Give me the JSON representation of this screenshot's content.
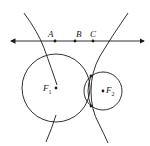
{
  "diagram": {
    "title": "",
    "colors": {
      "stroke": "#1a1a1a",
      "background": "#ffffff"
    },
    "line": {
      "name": "number-line",
      "arrows": "both"
    },
    "points": [
      {
        "label": "A",
        "x": 55,
        "y": 41
      },
      {
        "label": "B",
        "x": 75,
        "y": 41
      },
      {
        "label": "C",
        "x": 93,
        "y": 41
      }
    ],
    "foci": [
      {
        "label": "F",
        "subscript": "1",
        "x": 56,
        "y": 88
      },
      {
        "label": "F",
        "subscript": "2",
        "x": 103,
        "y": 91
      }
    ],
    "circles": [
      {
        "name": "circle-f1",
        "cx": 56,
        "cy": 88,
        "r": 34
      },
      {
        "name": "circle-f2",
        "cx": 103,
        "cy": 91,
        "r": 19
      }
    ],
    "curves": [
      "hyperbola-left-branch",
      "hyperbola-right-branch"
    ]
  }
}
